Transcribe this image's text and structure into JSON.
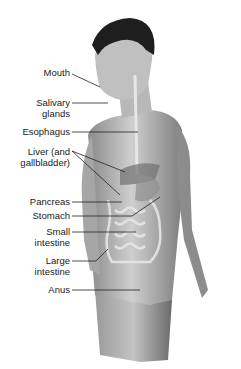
{
  "diagram": {
    "labels": [
      {
        "id": "mouth",
        "text": "Mouth",
        "top": 67
      },
      {
        "id": "salivary-glands",
        "text": "Salivary\nglands",
        "top": 106
      },
      {
        "id": "esophagus",
        "text": "Esophagus",
        "top": 125
      },
      {
        "id": "liver",
        "text": "Liver (and\ngallbladder)",
        "top": 147
      },
      {
        "id": "pancreas",
        "text": "Pancreas",
        "top": 198
      },
      {
        "id": "stomach",
        "text": "Stomach",
        "top": 212
      },
      {
        "id": "small-intestine",
        "text": "Small\nintestine",
        "top": 228
      },
      {
        "id": "large-intestine",
        "text": "Large\nintestine",
        "top": 257
      },
      {
        "id": "anus",
        "text": "Anus",
        "top": 286
      }
    ],
    "colors": {
      "background": "#ffffff",
      "text": "#1a1a1a",
      "leader": "#222222",
      "skin_light": "#c8c8c8",
      "skin_dark": "#6e6e6e",
      "hair": "#1e1e1e",
      "organ": "#e6e6e6"
    }
  }
}
